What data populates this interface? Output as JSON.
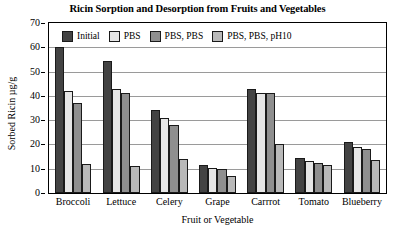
{
  "chart_data": {
    "type": "bar",
    "title": "Ricin Sorption and Desorption from Fruits and Vegetables",
    "xlabel": "Fruit or Vegetable",
    "ylabel": "Sorbed Ricin µg/g",
    "categories": [
      "Broccoli",
      "Lettuce",
      "Celery",
      "Grape",
      "Carrrot",
      "Tomato",
      "Blueberry"
    ],
    "series": [
      {
        "name": "Initial",
        "color": "#434343",
        "values": [
          60.0,
          54.5,
          34.0,
          11.5,
          43.0,
          14.5,
          21.0
        ]
      },
      {
        "name": "PBS",
        "color": "#e6e6e6",
        "values": [
          42.0,
          43.0,
          31.0,
          10.5,
          41.0,
          13.0,
          19.0
        ]
      },
      {
        "name": "PBS, PBS",
        "color": "#8f8f8f",
        "values": [
          37.0,
          41.0,
          28.0,
          10.0,
          41.0,
          12.5,
          18.0
        ]
      },
      {
        "name": "PBS, PBS, pH10",
        "color": "#b9b9b9",
        "values": [
          12.0,
          11.0,
          14.0,
          7.0,
          20.0,
          11.5,
          13.5
        ]
      }
    ],
    "ylim": [
      0,
      70
    ],
    "yticks": [
      0,
      10,
      20,
      30,
      40,
      50,
      60,
      70
    ],
    "ytick_labels": [
      "0",
      "10",
      "20",
      "30",
      "40",
      "50",
      "60",
      "70"
    ],
    "grid": true,
    "grid_axis": "y",
    "legend_position": "top-inside",
    "bar_edge_color": "#1a1a1a",
    "frame_color": "#000000"
  }
}
